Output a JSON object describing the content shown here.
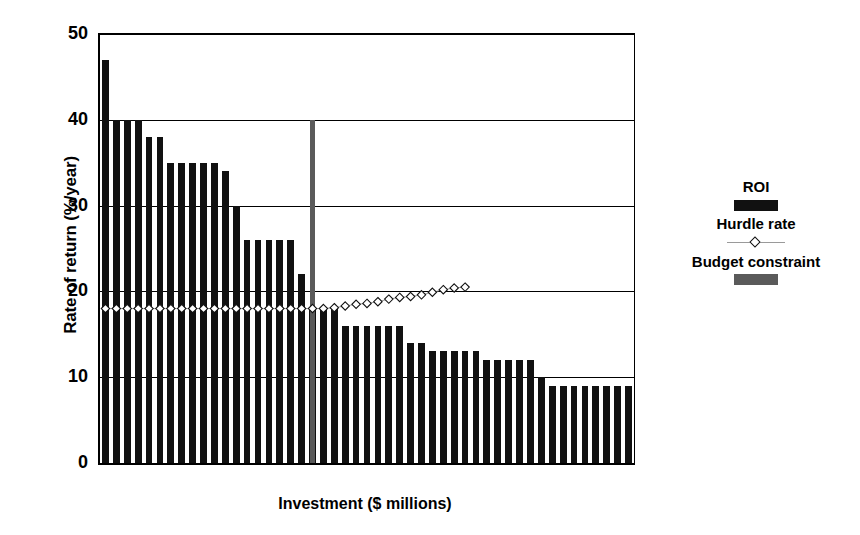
{
  "chart_data": {
    "type": "bar",
    "title": "",
    "xlabel": "Investment ($ millions)",
    "ylabel": "Rate of return (%/year)",
    "ylim": [
      0,
      50
    ],
    "yticks": [
      0,
      10,
      20,
      30,
      40,
      50
    ],
    "ytick_labels": [
      "0",
      "10",
      "20",
      "30",
      "40",
      "50"
    ],
    "xticks": [],
    "xtick_labels": [],
    "grid": "horizontal",
    "legend_position": "right",
    "series": [
      {
        "name": "ROI",
        "type": "bar",
        "color": "#111111",
        "values": [
          47,
          40,
          40,
          40,
          38,
          38,
          35,
          35,
          35,
          35,
          35,
          34,
          30,
          26,
          26,
          26,
          26,
          26,
          22,
          18,
          18,
          18,
          16,
          16,
          16,
          16,
          16,
          16,
          14,
          14,
          13,
          13,
          13,
          13,
          13,
          12,
          12,
          12,
          12,
          12,
          10,
          9,
          9,
          9,
          9,
          9,
          9,
          9,
          9
        ]
      },
      {
        "name": "Hurdle rate",
        "type": "line",
        "marker": "diamond",
        "color": "#9a9a9a",
        "marker_color": "#ffffff",
        "marker_edge_color": "#111111",
        "values": [
          18,
          18,
          18,
          18,
          18,
          18,
          18,
          18,
          18,
          18,
          18,
          18,
          18,
          18,
          18,
          18,
          18,
          18,
          18,
          18,
          18,
          18.1,
          18.3,
          18.5,
          18.6,
          18.8,
          19.1,
          19.3,
          19.4,
          19.6,
          19.9,
          20.2,
          20.4,
          20.5
        ]
      },
      {
        "name": "Budget constraint",
        "type": "vline-bar",
        "color": "#5a5a5a",
        "at_bar_index": 19,
        "height": 40
      }
    ],
    "legend_entries": [
      {
        "label": "ROI",
        "swatch": "filled-bar",
        "color": "#111111"
      },
      {
        "label": "Hurdle rate",
        "swatch": "line-diamond",
        "color": "#9a9a9a"
      },
      {
        "label": "Budget constraint",
        "swatch": "filled-bar",
        "color": "#5a5a5a"
      }
    ]
  },
  "axes": {
    "ylabel": "Rate of return (%/year)",
    "xlabel": "Investment ($ millions)",
    "ytick_labels": [
      "50",
      "40",
      "30",
      "20",
      "10",
      "0"
    ]
  },
  "legend": {
    "roi_label": "ROI",
    "hurdle_label": "Hurdle rate",
    "budget_label": "Budget constraint"
  }
}
